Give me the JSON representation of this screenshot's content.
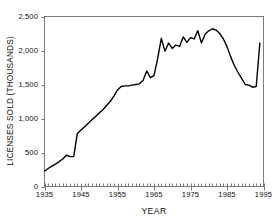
{
  "chart_data": {
    "type": "line",
    "title": "",
    "subtitle": "",
    "xlabel": "YEAR",
    "ylabel": "LICENSES SOLD (THOUSANDS)",
    "xlim": [
      1935,
      1995
    ],
    "ylim": [
      0,
      2500
    ],
    "xticks": [
      1935,
      1945,
      1955,
      1965,
      1975,
      1985,
      1995
    ],
    "xtick_labels": [
      "1935",
      "1945",
      "1955",
      "1965",
      "1975",
      "1985",
      "1995"
    ],
    "yticks": [
      0,
      500,
      1000,
      1500,
      2000,
      2500
    ],
    "ytick_labels": [
      "0",
      "500",
      "1,000",
      "1,500",
      "2,000",
      "2,500"
    ],
    "minor_xtick_interval": 1,
    "grid": false,
    "legend": null,
    "legend_position": "none",
    "line_color": "#000000",
    "line_width": 1.4,
    "axis_color": "#6e6e6e",
    "background": "#ffffff",
    "annotations": [],
    "series": [
      {
        "name": "Licenses sold",
        "x": [
          1935,
          1936,
          1937,
          1938,
          1939,
          1940,
          1941,
          1942,
          1943,
          1944,
          1945,
          1946,
          1947,
          1948,
          1949,
          1950,
          1951,
          1952,
          1953,
          1954,
          1955,
          1956,
          1957,
          1958,
          1959,
          1960,
          1961,
          1962,
          1963,
          1964,
          1965,
          1966,
          1967,
          1968,
          1969,
          1970,
          1971,
          1972,
          1973,
          1974,
          1975,
          1976,
          1977,
          1978,
          1979,
          1980,
          1981,
          1982,
          1983,
          1984,
          1985,
          1986,
          1987,
          1988,
          1989,
          1990,
          1991,
          1992,
          1993,
          1994
        ],
        "values": [
          225,
          265,
          300,
          330,
          365,
          405,
          460,
          440,
          440,
          780,
          830,
          880,
          930,
          980,
          1030,
          1080,
          1130,
          1190,
          1250,
          1330,
          1420,
          1470,
          1480,
          1480,
          1490,
          1500,
          1510,
          1560,
          1700,
          1600,
          1630,
          1880,
          2180,
          1990,
          2110,
          2030,
          2080,
          2060,
          2200,
          2120,
          2190,
          2170,
          2290,
          2110,
          2240,
          2290,
          2320,
          2300,
          2250,
          2170,
          2060,
          1910,
          1780,
          1680,
          1590,
          1500,
          1490,
          1460,
          1470,
          2110
        ]
      }
    ]
  },
  "axis": {
    "ylabel": "LICENSES SOLD (THOUSANDS)",
    "xlabel": "YEAR"
  }
}
